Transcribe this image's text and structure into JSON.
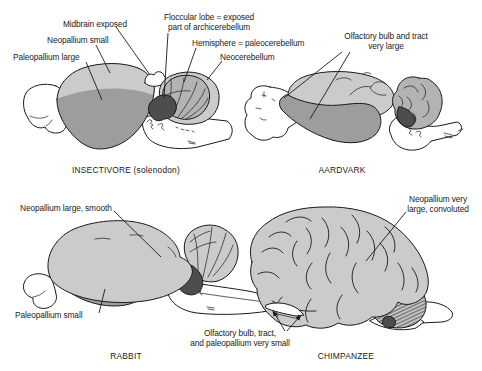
{
  "figure_type": "comparative brain anatomy diagram",
  "panels": {
    "insectivore": {
      "caption": "INSECTIVORE (solenodon)",
      "labels": {
        "midbrain": "Midbrain exposed",
        "neopallium": "Neopallium small",
        "paleopallium": "Paleopallium large",
        "floccular_line1": "Floccular lobe = exposed",
        "floccular_line2": "part of archicerebellum",
        "hemisphere": "Hemisphere = paleocerebellum",
        "neocerebellum": "Neocerebellum"
      }
    },
    "aardvark": {
      "caption": "AARDVARK",
      "labels": {
        "olfactory_line1": "Olfactory bulb and tract",
        "olfactory_line2": "very large"
      }
    },
    "rabbit": {
      "caption": "RABBIT",
      "labels": {
        "neopallium": "Neopallium large, smooth",
        "paleopallium": "Paleopallium small"
      }
    },
    "chimpanzee": {
      "caption": "CHIMPANZEE",
      "labels": {
        "neopallium_line1": "Neopallium very",
        "neopallium_line2": "large, convoluted",
        "olfactory_line1": "Olfactory bulb, tract,",
        "olfactory_line2": "and paleopallium very small"
      }
    }
  },
  "colors": {
    "background": "#ffffff",
    "outline": "#1a1a1a",
    "neopallium_light": "#cbcbcb",
    "paleopallium_dark": "#9d9d9d",
    "cerebellum_mid": "#b3b3b3",
    "flocculus_dark": "#4d4d4d",
    "white_structure": "#ffffff"
  }
}
